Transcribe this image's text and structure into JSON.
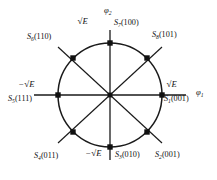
{
  "diagram": {
    "type": "8-PSK signal constellation",
    "center": {
      "x": 110,
      "y": 95
    },
    "radius": 52,
    "axes": {
      "horizontal": {
        "symbol": "φ",
        "subscript": "1",
        "label": "φ₁"
      },
      "vertical": {
        "symbol": "φ",
        "subscript": "2",
        "label": "φ₂"
      }
    },
    "amplitudes": {
      "pos_right": {
        "sign": "",
        "text": "E"
      },
      "neg_left": {
        "sign": "−",
        "text": "E"
      },
      "pos_top": {
        "sign": "",
        "text": "E"
      },
      "neg_bottom": {
        "sign": "−",
        "text": "E"
      }
    },
    "points": [
      {
        "name": "S1",
        "sym": "S",
        "sub": "1",
        "bits": "(001)",
        "angle_deg": 0,
        "x": 162,
        "y": 95
      },
      {
        "name": "S2",
        "sym": "S",
        "sub": "2",
        "bits": "(001)",
        "angle_deg": -45,
        "x": 147,
        "y": 132
      },
      {
        "name": "S3",
        "sym": "S",
        "sub": "3",
        "bits": "(010)",
        "angle_deg": -90,
        "x": 110,
        "y": 147
      },
      {
        "name": "S4",
        "sym": "S",
        "sub": "4",
        "bits": "(011)",
        "angle_deg": -135,
        "x": 73,
        "y": 132
      },
      {
        "name": "S5",
        "sym": "S",
        "sub": "5",
        "bits": "(111)",
        "angle_deg": 180,
        "x": 58,
        "y": 95
      },
      {
        "name": "S6",
        "sym": "S",
        "sub": "6",
        "bits": "(110)",
        "angle_deg": 135,
        "x": 73,
        "y": 58
      },
      {
        "name": "S7",
        "sym": "S",
        "sub": "7",
        "bits": "(100)",
        "angle_deg": 90,
        "x": 110,
        "y": 43
      },
      {
        "name": "S8",
        "sym": "S",
        "sub": "8",
        "bits": "(101)",
        "angle_deg": 45,
        "x": 147,
        "y": 58
      }
    ],
    "colors": {
      "stroke": "#1a1a1a",
      "marker": "#111111",
      "background": "#ffffff"
    }
  }
}
